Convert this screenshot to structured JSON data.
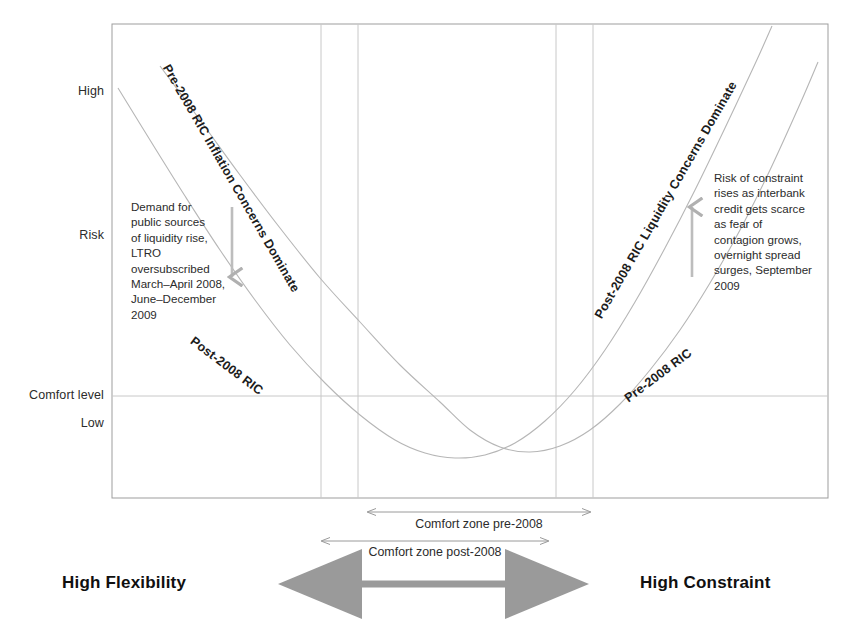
{
  "chart_data": {
    "type": "line",
    "title": "",
    "xlabel": "",
    "ylabel": "Risk",
    "grid": false,
    "legend_position": "inline-curve-labels",
    "axis_box": {
      "left": 112,
      "top": 24,
      "right": 828,
      "bottom": 498
    },
    "x_axis": {
      "left_end_label": "High Flexibility",
      "right_end_label": "High Constraint",
      "range_description": "Reserve / liquidity constraint continuum from high flexibility (left) to high constraint (right)"
    },
    "y_axis": {
      "ticks": [
        {
          "label": "High",
          "y": 92
        },
        {
          "label": "Risk",
          "y": 236
        },
        {
          "label": "Comfort level",
          "y": 396
        },
        {
          "label": "Low",
          "y": 424
        }
      ],
      "comfort_level_line_y": 396
    },
    "vertical_markers": [
      {
        "name": "comfort-zone-post-2008-left",
        "x": 321
      },
      {
        "name": "comfort-zone-pre-2008-left",
        "x": 358
      },
      {
        "name": "comfort-zone-pre-2008-right",
        "x": 556
      },
      {
        "name": "comfort-zone-post-2008-right",
        "x": 593
      }
    ],
    "series": [
      {
        "name": "Pre-2008 RIC",
        "description": "U-shaped pre-2008 reserve indifference curve: high inflation-concern risk at left, minimum inside comfort zone, rising to the right",
        "points": [
          [
            160,
            66
          ],
          [
            200,
            120
          ],
          [
            240,
            175
          ],
          [
            280,
            228
          ],
          [
            320,
            278
          ],
          [
            360,
            322
          ],
          [
            400,
            365
          ],
          [
            440,
            402
          ],
          [
            470,
            430
          ],
          [
            500,
            447
          ],
          [
            530,
            452
          ],
          [
            560,
            446
          ],
          [
            590,
            430
          ],
          [
            620,
            404
          ],
          [
            650,
            370
          ],
          [
            680,
            330
          ],
          [
            710,
            283
          ],
          [
            740,
            230
          ],
          [
            770,
            170
          ],
          [
            800,
            104
          ],
          [
            818,
            62
          ]
        ]
      },
      {
        "name": "Post-2008 RIC",
        "description": "U-shaped post-2008 reserve indifference curve: shifted so minimum and steep liquidity-risk rise occur further left",
        "points": [
          [
            118,
            88
          ],
          [
            150,
            140
          ],
          [
            185,
            196
          ],
          [
            220,
            250
          ],
          [
            255,
            300
          ],
          [
            290,
            345
          ],
          [
            325,
            383
          ],
          [
            360,
            415
          ],
          [
            395,
            440
          ],
          [
            425,
            453
          ],
          [
            455,
            458
          ],
          [
            485,
            455
          ],
          [
            515,
            443
          ],
          [
            545,
            421
          ],
          [
            575,
            390
          ],
          [
            605,
            350
          ],
          [
            635,
            302
          ],
          [
            665,
            248
          ],
          [
            695,
            190
          ],
          [
            725,
            128
          ],
          [
            755,
            64
          ],
          [
            772,
            26
          ]
        ]
      }
    ],
    "curve_labels": [
      {
        "name": "pre-2008-inflation-label",
        "text": "Pre-2008 RIC Inflation Concerns Dominate",
        "x": 172,
        "y": 62,
        "rotation": 60
      },
      {
        "name": "post-2008-liquidity-label",
        "text": "Post-2008 RIC Liquidity Concerns Dominate",
        "x": 592,
        "y": 314,
        "rotation": -60
      },
      {
        "name": "post-2008-ric-label",
        "text": "Post-2008 RIC",
        "x": 196,
        "y": 334,
        "rotation": 37
      },
      {
        "name": "pre-2008-ric-label",
        "text": "Pre-2008 RIC",
        "x": 622,
        "y": 394,
        "rotation": -37
      }
    ],
    "annotations": [
      {
        "name": "left-annotation",
        "text": "Demand for\npublic sources\nof liquidity rise,\nLTRO\noversubscribed\nMarch–April 2008,\nJune–December  2009",
        "x": 131,
        "y": 199,
        "arrow": {
          "x": 232,
          "y1": 207,
          "y2": 277,
          "direction": "down"
        }
      },
      {
        "name": "right-annotation",
        "text": "Risk of constraint\nrises as interbank\ncredit gets scarce\nas fear of\ncontagion grows,\novernight spread\nsurges, September\n2009",
        "x": 714,
        "y": 170,
        "arrow": {
          "x": 692,
          "y1": 277,
          "y2": 207,
          "direction": "up"
        }
      }
    ],
    "zone_bars": [
      {
        "name": "comfort-zone-pre-2008",
        "label": "Comfort zone pre-2008",
        "x1": 368,
        "x2": 590,
        "y": 512,
        "label_y": 517
      },
      {
        "name": "comfort-zone-post-2008",
        "label": "Comfort zone post-2008",
        "x1": 322,
        "x2": 548,
        "y": 541,
        "label_y": 545
      }
    ],
    "flexibility_arrow": {
      "name": "flexibility-constraint-arrow",
      "x1": 292,
      "x2": 575,
      "y": 584,
      "color": "#9a9a9a"
    },
    "colors": {
      "curve": "#b6b6b6",
      "axis": "#9d9d9d",
      "gridline": "#c8c8c8",
      "text": "#2b2b2b",
      "arrow_gray": "#9a9a9a",
      "background": "#ffffff"
    }
  }
}
